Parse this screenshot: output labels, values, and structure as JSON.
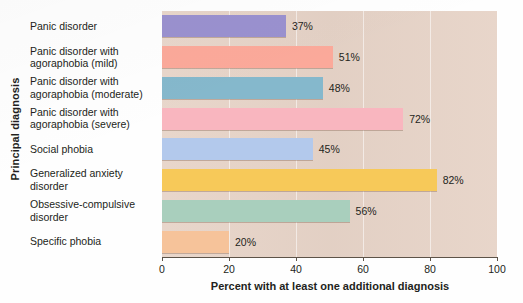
{
  "chart_data": {
    "type": "bar",
    "orientation": "horizontal",
    "title": "",
    "xlabel": "Percent with at least one additional diagnosis",
    "ylabel": "Principal diagnosis",
    "xlim": [
      0,
      100
    ],
    "xticks": [
      "0",
      "20",
      "40",
      "60",
      "80",
      "100"
    ],
    "xtick_values": [
      0,
      20,
      40,
      60,
      80,
      100
    ],
    "grid": "vertical-light",
    "legend": "none",
    "categories": [
      "Panic disorder",
      "Panic disorder with agoraphobia (mild)",
      "Panic disorder with agoraphobia (moderate)",
      "Panic disorder with agoraphobia (severe)",
      "Social phobia",
      "Generalized anxiety disorder",
      "Obsessive-compulsive disorder",
      "Specific phobia"
    ],
    "category_lines": [
      [
        "Panic disorder",
        ""
      ],
      [
        "Panic disorder with",
        "agoraphobia (mild)"
      ],
      [
        "Panic disorder with",
        "agoraphobia (moderate)"
      ],
      [
        "Panic disorder with",
        "agoraphobia (severe)"
      ],
      [
        "Social phobia",
        ""
      ],
      [
        "Generalized anxiety",
        "disorder"
      ],
      [
        "Obsessive-compulsive",
        "disorder"
      ],
      [
        "Specific phobia",
        ""
      ]
    ],
    "values": [
      37,
      51,
      48,
      72,
      45,
      82,
      56,
      20
    ],
    "value_labels": [
      "37%",
      "51%",
      "48%",
      "72%",
      "45%",
      "82%",
      "56%",
      "20%"
    ],
    "bar_colors": [
      "#9a91cf",
      "#fba99a",
      "#85b8cc",
      "#f9b6bf",
      "#b3c9ec",
      "#f7c959",
      "#a9cfbd",
      "#f6c39a"
    ],
    "plot_background": "#e7d4c8",
    "page_background": "#ffffff"
  }
}
